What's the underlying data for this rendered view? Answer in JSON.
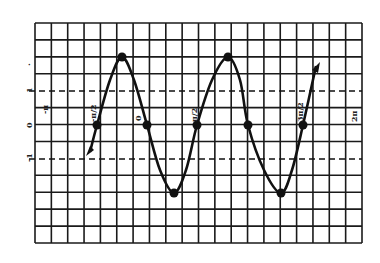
{
  "chart_data": {
    "type": "line",
    "title": "",
    "xlabel": "",
    "ylabel": "",
    "function": "y = -2 sin(2x) (sinusoid, amplitude 2)",
    "grid": true,
    "reference_lines": [
      {
        "y": 1,
        "style": "dashed",
        "label": "1"
      },
      {
        "y": -1,
        "style": "dashed",
        "label": "-1"
      }
    ],
    "x_tick_labels": [
      {
        "label": "-π",
        "px": 46
      },
      {
        "label": "-π/2",
        "px": 97
      },
      {
        "label": "0",
        "px": 147
      },
      {
        "label": "π/2",
        "px": 197
      },
      {
        "label": "3π/2",
        "px": 303
      },
      {
        "label": "2π",
        "px": 355
      }
    ],
    "y_tick_labels": [
      {
        "label": "2",
        "value": 2
      },
      {
        "label": "1",
        "value": 1
      },
      {
        "label": "0",
        "value": 0
      },
      {
        "label": "-1",
        "value": -1
      }
    ],
    "series": [
      {
        "name": "curve",
        "points_px": [
          [
            90,
            152
          ],
          [
            97,
            125
          ],
          [
            110,
            80
          ],
          [
            122,
            57
          ],
          [
            134,
            80
          ],
          [
            147,
            125
          ],
          [
            160,
            170
          ],
          [
            174,
            193
          ],
          [
            186,
            170
          ],
          [
            197,
            125
          ],
          [
            212,
            80
          ],
          [
            228,
            57
          ],
          [
            240,
            80
          ],
          [
            248,
            125
          ],
          [
            264,
            170
          ],
          [
            281,
            193
          ],
          [
            292,
            170
          ],
          [
            303,
            125
          ],
          [
            316,
            66
          ]
        ],
        "marked_points_px": [
          [
            97,
            125
          ],
          [
            122,
            57
          ],
          [
            147,
            125
          ],
          [
            174,
            193
          ],
          [
            197,
            125
          ],
          [
            228,
            57
          ],
          [
            248,
            125
          ],
          [
            281,
            193
          ],
          [
            303,
            125
          ]
        ],
        "key_points": [
          {
            "x": "-π/2",
            "y": 0
          },
          {
            "x": "peak",
            "y": 2
          },
          {
            "x": "0",
            "y": 0
          },
          {
            "x": "trough",
            "y": -2
          },
          {
            "x": "π/2",
            "y": 0
          },
          {
            "x": "peak",
            "y": 2
          },
          {
            "x": "zero",
            "y": 0
          },
          {
            "x": "trough",
            "y": -2
          },
          {
            "x": "3π/2",
            "y": 0
          }
        ],
        "arrows": [
          "start-down-left",
          "end-up-right"
        ]
      }
    ],
    "grid_px": {
      "left": 35,
      "right": 362,
      "top": 23,
      "bottom": 243,
      "cols": 20,
      "rows": 13,
      "x_axis_px": 125,
      "unit_px": 34
    }
  },
  "labels": {
    "y2": ".",
    "y1": "1",
    "y0": "0",
    "ym1": "-1",
    "xm_pi": "-π",
    "xm_half_pi": "-π/2",
    "x0": "0",
    "x_half_pi": "π/2",
    "x_three_half_pi": "3π/2",
    "x_two_pi": "2π"
  }
}
